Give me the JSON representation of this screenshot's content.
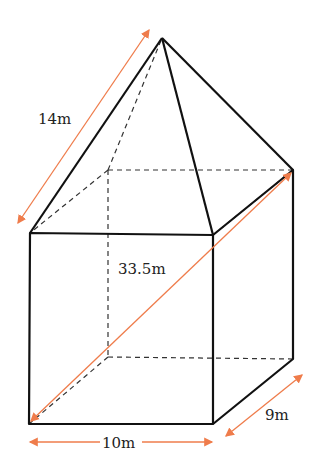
{
  "figure": {
    "colors": {
      "edge": "#111111",
      "hidden_edge": "#333333",
      "dimension_arrow": "#ef7c4b"
    },
    "labels": {
      "slant_edge": "14m",
      "space_diagonal": "33.5m",
      "width": "10m",
      "depth": "9m"
    }
  }
}
